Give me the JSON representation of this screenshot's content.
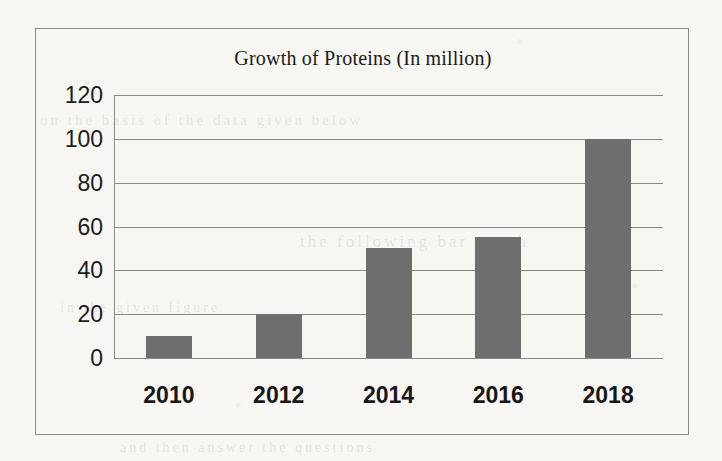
{
  "chart_data": {
    "type": "bar",
    "title": "Growth of Proteins (In million)",
    "xlabel": "",
    "ylabel": "",
    "categories": [
      "2010",
      "2012",
      "2014",
      "2016",
      "2018"
    ],
    "values": [
      10,
      20,
      50,
      55,
      100
    ],
    "series": [
      {
        "name": "Growth of Proteins",
        "values": [
          10,
          20,
          50,
          55,
          100
        ]
      }
    ],
    "ylim": [
      0,
      120
    ],
    "y_ticks": [
      0,
      20,
      40,
      60,
      80,
      100,
      120
    ],
    "y_tick_labels": [
      "0",
      "20",
      "40",
      "60",
      "80",
      "100",
      "120"
    ],
    "grid": true,
    "grid_axis": "y",
    "legend": false,
    "legend_position": "none",
    "bar_color": "#6e6e6e",
    "gridline_color": "#8c8a85",
    "frame_color": "#8e8b85",
    "background_color": "#f7f6f2",
    "text_color": "#1c1b1a"
  },
  "ghost_text": [
    {
      "text": "on  the  basis  of  the  data  given  below",
      "left": 40,
      "top": 112,
      "size": 15
    },
    {
      "text": "the  following  bar  graph",
      "left": 300,
      "top": 232,
      "size": 17
    },
    {
      "text": "in  the  given  figure",
      "left": 60,
      "top": 300,
      "size": 14
    },
    {
      "text": "and  then  answer  the  questions",
      "left": 120,
      "top": 440,
      "size": 14
    }
  ]
}
